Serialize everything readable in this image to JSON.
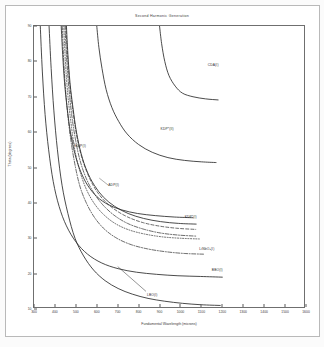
{
  "figure": {
    "title": "Second Harmonic Generation",
    "xlabel": "Fundamental Wavelength (microns)",
    "ylabel": "Theta (degrees)"
  },
  "chart_data": {
    "type": "line",
    "title": "Second Harmonic Generation",
    "xlabel": "Fundamental Wavelength (microns)",
    "ylabel": "Theta (degrees)",
    "xlim": [
      300,
      1600
    ],
    "ylim": [
      10,
      90
    ],
    "grid": false,
    "legend": "inline-annotations",
    "xticks": [
      300,
      400,
      500,
      600,
      700,
      800,
      900,
      1000,
      1100,
      1200,
      1300,
      1400,
      1500,
      1600
    ],
    "yticks": [
      10,
      20,
      30,
      40,
      50,
      60,
      70,
      80,
      90
    ],
    "series": [
      {
        "name": "CDA(I)",
        "label": "CDA(I)",
        "style": "solid",
        "label_x": 1130,
        "label_y": 79,
        "points": [
          [
            900,
            90
          ],
          [
            910,
            85
          ],
          [
            925,
            80
          ],
          [
            945,
            76
          ],
          [
            975,
            73
          ],
          [
            1010,
            71
          ],
          [
            1060,
            70
          ],
          [
            1120,
            69.4
          ],
          [
            1180,
            69.1
          ]
        ]
      },
      {
        "name": "KDP*(II)",
        "label": "KDP*(II)",
        "style": "solid",
        "label_x": 905,
        "label_y": 61,
        "points": [
          [
            600,
            90
          ],
          [
            610,
            84
          ],
          [
            625,
            78
          ],
          [
            645,
            72
          ],
          [
            672,
            67
          ],
          [
            705,
            63
          ],
          [
            745,
            59.5
          ],
          [
            800,
            56.5
          ],
          [
            865,
            54.3
          ],
          [
            940,
            52.8
          ],
          [
            1020,
            52
          ],
          [
            1100,
            51.6
          ],
          [
            1170,
            51.4
          ]
        ]
      },
      {
        "name": "KDP(I)",
        "label": "KDP(I)",
        "style": "solid",
        "label_x": 497,
        "label_y": 56,
        "points": [
          [
            430,
            90
          ],
          [
            437,
            82
          ],
          [
            446,
            74
          ],
          [
            458,
            67
          ],
          [
            474,
            60
          ],
          [
            495,
            54
          ],
          [
            522,
            49
          ],
          [
            556,
            45
          ],
          [
            600,
            41.8
          ],
          [
            655,
            39.5
          ],
          [
            720,
            38
          ],
          [
            795,
            37
          ],
          [
            880,
            36.4
          ],
          [
            970,
            36
          ],
          [
            1060,
            35.8
          ]
        ]
      },
      {
        "name": "ADP(I)",
        "label": "ADP(I)",
        "style": "solid",
        "label_x": 655,
        "label_y": 45,
        "points": [
          [
            455,
            90
          ],
          [
            462,
            82
          ],
          [
            472,
            74
          ],
          [
            486,
            67
          ],
          [
            503,
            60
          ],
          [
            525,
            54
          ],
          [
            553,
            49
          ],
          [
            588,
            45
          ],
          [
            632,
            41.6
          ],
          [
            686,
            39
          ],
          [
            750,
            37
          ],
          [
            824,
            35.6
          ],
          [
            905,
            34.7
          ],
          [
            990,
            34.2
          ],
          [
            1075,
            34
          ]
        ]
      },
      {
        "name": "ADP(II)",
        "label": "ADP(II)",
        "style": "dashed",
        "label_x": 0,
        "label_y": 0,
        "points": [
          [
            452,
            90
          ],
          [
            460,
            82
          ],
          [
            470,
            74
          ],
          [
            484,
            67
          ],
          [
            501,
            60
          ],
          [
            523,
            54
          ],
          [
            551,
            49
          ],
          [
            586,
            44.6
          ],
          [
            630,
            41
          ],
          [
            684,
            38.2
          ],
          [
            748,
            36
          ],
          [
            822,
            34.4
          ],
          [
            903,
            33.4
          ],
          [
            988,
            32.8
          ],
          [
            1073,
            32.5
          ]
        ]
      },
      {
        "name": "KDP(II)",
        "label": "KDP(II)",
        "style": "dashdot",
        "label_x": 0,
        "label_y": 0,
        "points": [
          [
            448,
            90
          ],
          [
            456,
            81
          ],
          [
            466,
            73
          ],
          [
            480,
            65
          ],
          [
            498,
            58
          ],
          [
            520,
            52
          ],
          [
            549,
            47
          ],
          [
            584,
            43
          ],
          [
            628,
            39.5
          ],
          [
            683,
            36.5
          ],
          [
            747,
            34.2
          ],
          [
            822,
            32.6
          ],
          [
            903,
            31.5
          ],
          [
            989,
            30.9
          ],
          [
            1075,
            30.6
          ]
        ]
      },
      {
        "name": "KDP*(I)",
        "label": "KDP*(I)",
        "style": "dotted",
        "label_x": 1020,
        "label_y": 36,
        "points": [
          [
            442,
            90
          ],
          [
            450,
            80
          ],
          [
            461,
            71
          ],
          [
            476,
            63
          ],
          [
            495,
            55
          ],
          [
            519,
            49
          ],
          [
            549,
            44
          ],
          [
            586,
            40
          ],
          [
            631,
            36.8
          ],
          [
            687,
            34.2
          ],
          [
            752,
            32.4
          ],
          [
            828,
            31.2
          ],
          [
            912,
            30.4
          ],
          [
            1000,
            30
          ],
          [
            1090,
            29.8
          ]
        ]
      },
      {
        "name": "LiNbO3(I)",
        "label": "LiNbO₃(I)",
        "style": "dashdot",
        "label_x": 1090,
        "label_y": 27,
        "points": [
          [
            435,
            90
          ],
          [
            443,
            79
          ],
          [
            455,
            69
          ],
          [
            471,
            60
          ],
          [
            492,
            52
          ],
          [
            518,
            45
          ],
          [
            550,
            40
          ],
          [
            590,
            35.8
          ],
          [
            638,
            32.5
          ],
          [
            696,
            30
          ],
          [
            764,
            28.2
          ],
          [
            842,
            27
          ],
          [
            928,
            26.2
          ],
          [
            1018,
            25.7
          ],
          [
            1110,
            25.5
          ]
        ]
      },
      {
        "name": "BBO(I)",
        "label": "BBO(I)",
        "style": "solid",
        "label_x": 1150,
        "label_y": 21,
        "points": [
          [
            330,
            90
          ],
          [
            340,
            77
          ],
          [
            353,
            65
          ],
          [
            370,
            55
          ],
          [
            392,
            46
          ],
          [
            420,
            39
          ],
          [
            455,
            33.5
          ],
          [
            500,
            29
          ],
          [
            556,
            25.5
          ],
          [
            624,
            23
          ],
          [
            702,
            21.4
          ],
          [
            790,
            20.4
          ],
          [
            886,
            19.8
          ],
          [
            988,
            19.4
          ],
          [
            1095,
            19.2
          ],
          [
            1200,
            19
          ]
        ]
      },
      {
        "name": "LBO(I)",
        "label": "LBO(I)",
        "style": "solid",
        "label_x": 840,
        "label_y": 14,
        "points": [
          [
            372,
            90
          ],
          [
            382,
            78
          ],
          [
            395,
            66
          ],
          [
            412,
            55
          ],
          [
            434,
            45
          ],
          [
            462,
            37
          ],
          [
            496,
            30
          ],
          [
            537,
            25
          ],
          [
            585,
            21
          ],
          [
            640,
            18
          ],
          [
            702,
            15.8
          ],
          [
            770,
            14.2
          ],
          [
            845,
            13
          ],
          [
            925,
            12.2
          ],
          [
            1010,
            11.6
          ],
          [
            1100,
            11.2
          ],
          [
            1190,
            11
          ]
        ]
      }
    ]
  }
}
